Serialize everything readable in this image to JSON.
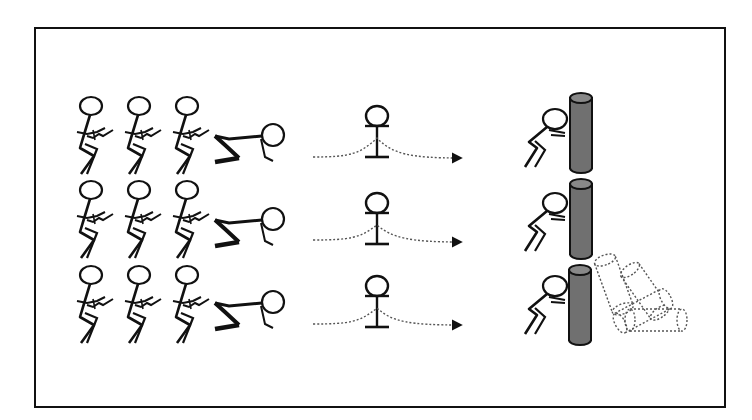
{
  "diagram": {
    "colors": {
      "line": "#111111",
      "cylinder_fill": "#6f6f6f",
      "frame": "#111111",
      "dotted": "#555555"
    },
    "rows": [
      {
        "label": "row-1",
        "queue_count": 3,
        "crouched": true,
        "obstacle": true,
        "arrow": true,
        "pusher": true,
        "cylinder_state": "upright",
        "fallen_cylinders": 0
      },
      {
        "label": "row-2",
        "queue_count": 3,
        "crouched": true,
        "obstacle": true,
        "arrow": true,
        "pusher": true,
        "cylinder_state": "upright",
        "fallen_cylinders": 0
      },
      {
        "label": "row-3",
        "queue_count": 3,
        "crouched": true,
        "obstacle": true,
        "arrow": true,
        "pusher": true,
        "cylinder_state": "toppling",
        "fallen_cylinders": 4
      }
    ]
  }
}
